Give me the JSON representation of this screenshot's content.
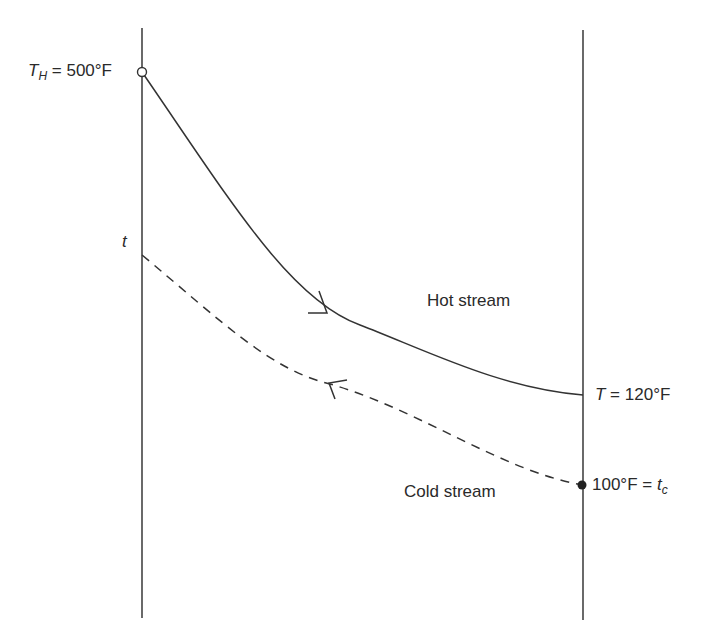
{
  "diagram": {
    "type": "heat-exchanger temperature profile",
    "hot_stream": {
      "label": "Hot stream",
      "inlet": {
        "symbol": "T",
        "subscript": "H",
        "value": "500°F",
        "text": " = 500°F"
      },
      "outlet": {
        "symbol": "T",
        "value": "120°F",
        "text": " = 120°F"
      },
      "direction": "left-to-right",
      "line_style": "solid"
    },
    "cold_stream": {
      "label": "Cold stream",
      "inlet": {
        "symbol": "t",
        "subscript": "c",
        "value": "100°F",
        "text": "100°F = "
      },
      "outlet": {
        "symbol": "t"
      },
      "direction": "right-to-left",
      "line_style": "dashed"
    },
    "colors": {
      "line": "#333333",
      "text": "#2a2a2a",
      "background": "#ffffff"
    }
  }
}
